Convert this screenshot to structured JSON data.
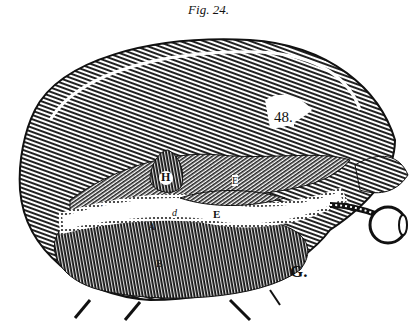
{
  "caption": "Fig. 24.",
  "labels": {
    "num": "48.",
    "h": "H",
    "f": "F",
    "e_upper": "E",
    "e_lower": "E",
    "d": "d",
    "a": "A",
    "b": "B",
    "g": "G."
  },
  "colors": {
    "ink": "#111111",
    "paper": "#ffffff"
  }
}
